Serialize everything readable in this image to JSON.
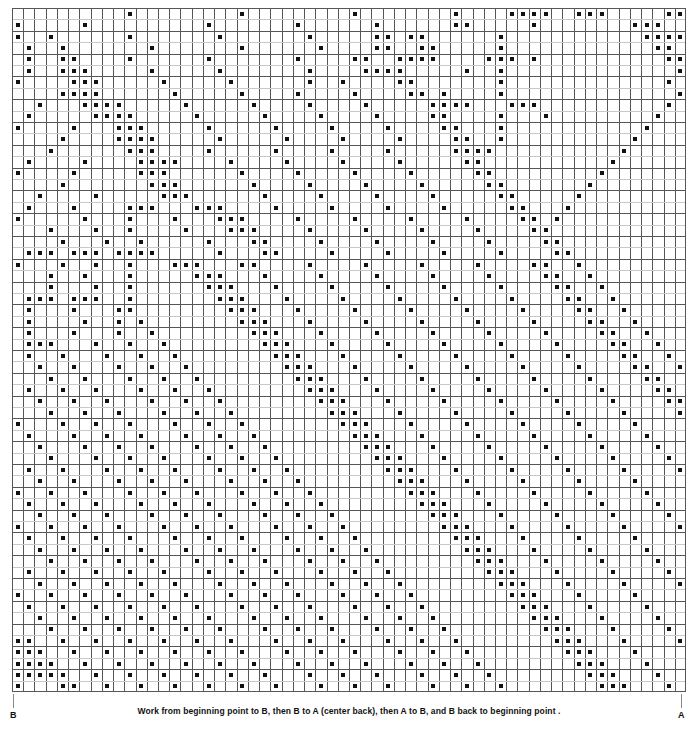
{
  "document": {
    "type": "filet-crochet-chart",
    "title": "Filet Crochet Pattern Chart"
  },
  "caption": {
    "text": "Work from beginning point to B, then B to A (center back), then A to B, and B back to beginning point ."
  },
  "markers": {
    "left_label": "B",
    "right_label": "A"
  },
  "colors": {
    "background": "#ffffff",
    "grid_line_major": "#55565a",
    "grid_line_minor": "#c8c9cb",
    "cell_fill": "#ffffff",
    "dot": "#111111",
    "text": "#111111",
    "tick": "#8a8a8a"
  },
  "chart_data": {
    "type": "heatmap",
    "xlabel": "",
    "ylabel": "",
    "grid": true,
    "legend": "none",
    "columns": 60,
    "rows": 60,
    "cell_width": 11.233,
    "cell_height": 11.4,
    "value_meaning": {
      "1": "filled stitch (black square)",
      "0": "open mesh (empty cell)"
    },
    "x": [
      1,
      2,
      3,
      4,
      5,
      6,
      7,
      8,
      9,
      10,
      11,
      12,
      13,
      14,
      15,
      16,
      17,
      18,
      19,
      20,
      21,
      22,
      23,
      24,
      25,
      26,
      27,
      28,
      29,
      30,
      31,
      32,
      33,
      34,
      35,
      36,
      37,
      38,
      39,
      40,
      41,
      42,
      43,
      44,
      45,
      46,
      47,
      48,
      49,
      50,
      51,
      52,
      53,
      54,
      55,
      56,
      57,
      58,
      59,
      60
    ],
    "rows_data": [
      "000000000010000000001000000000100000000100001111001110000011",
      "100000100000000001000000010000001000000110000010000000011100",
      "100100000010000000100000001000001101100000010000000000001111",
      "010010000000100000001000000100001100110000010000000000000110",
      "010011000010000001000000010000110011110000111010000000000011",
      "010011100000100000100000001000011110000010010000000000000001",
      "100001110000010000010000001001000011000000010000000000000010",
      "000011110000001000001000010000100001101000010000000000000001",
      "001000111100000100000100001000010000011110001110000000000010",
      "010000011110000010000010000100001000011000010001000000000100",
      "100001000111000001000001000010000100001100010000000000001000",
      "000010000111100000100000100001000010000110010000000000010000",
      "000100000011100001000001000010000100000111100000000000100000",
      "010000100001111000010000100001000010000011000000000001000000",
      "100001000001110000001000010000100001000001100000000010000000",
      "000010000000111000000100001000010000100000110000000100000000",
      "001000010000011100000010000100001000010000011000001000000000",
      "010001000011100011100001000010000100001000001100010000000000",
      "100000100010001000111000010000100001000010000110100000000000",
      "000100010010000100011100001000010000100001000011000000000000",
      "000010001001000001000110000100001000010000100001100000000000",
      "011101110111100000100011000010000100001000010000110000000000",
      "100010010010001110001100001000010000100001000011001000000000",
      "000100100010000011100010000100001000010000100001100100000000",
      "000100010010000001110001000010000100001000010000110010000000",
      "011101110010000000111000100001000010000100001000011001000000",
      "010001000110000000011100010000100001000010000100001100100000",
      "010000100101000000001110001000010000100001000010000110010000",
      "010001000100100000000111000100001000010000100001000011001000",
      "011100010010010000000011100010000100001000010000100001100100",
      "010010001001001000000001110001000010000100001000010000110010",
      "001001000100100100000000111000100001000010000100001000011001",
      "000100100010010010000000011100010000100001000010000100001100",
      "010010010001001001000000001110001000010000100001000010000110",
      "001001001000100100100000000111000100001000010000100001000011",
      "000100100100010010010000000011100010000100001000010000100001",
      "100010010010001001001000000001110001000010000100001000010000",
      "010001001001000100100100000000111000100001000010000100001000",
      "001000100100100010010010000000011100010000100001000010000100",
      "000100010010010001001001000000001110001000010000100001000010",
      "010010001001001000100100100000000111000100001000010000100001",
      "001001000100100100010010010000000011100010000100001000010000",
      "100100100010010010001001001000000001110001000010000100001000",
      "010010010001001001000100100100000000111000100001000010000100",
      "001001001000100100100010010010000000011100010000100001000010",
      "100100100100010010010001001001000000001110001000010000100001",
      "010010010010001001001000100100100000000111000100001000010000",
      "001001001001000100100100010010010000000011100010000100001000",
      "000100100100100010010010001001001000000001110001000010000100",
      "010010010010010001001001000100100100000000111000100001000010",
      "001001001001001000100100100010010010000000011100010000100001",
      "100100100100100100010010010001001001000000001110001000010000",
      "010010010010010010001001001000100100100000000111000100001000",
      "001001001001001001000100100100010010010000000011100010000100",
      "000100100100100100100010010010001001001000000001110001000010",
      "110010010010010010010001001001000100100100000000111000100001",
      "111001001001001001001000100100100010010010000000011100010000",
      "111100100100100100100100010010010001001001000000001110001000",
      "111110010010010010010010001001001000100100100000000111000100",
      "100011001001001001001001000100100100010010010000000011100010"
    ]
  }
}
